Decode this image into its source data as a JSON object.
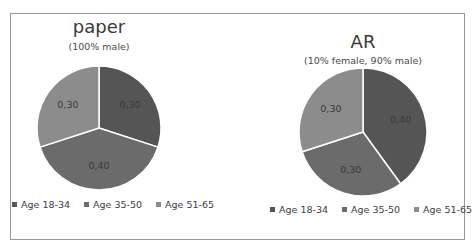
{
  "chart_data": [
    {
      "type": "pie",
      "title": "paper",
      "subtitle": "(100% male)",
      "categories": [
        "Age 18-34",
        "Age 35-50",
        "Age 51-65"
      ],
      "values": [
        0.3,
        0.4,
        0.3
      ],
      "data_labels": [
        "0,30",
        "0,40",
        "0,30"
      ],
      "colors": [
        "#555555",
        "#6b6b6b",
        "#8c8c8c"
      ],
      "legend_position": "bottom"
    },
    {
      "type": "pie",
      "title": "AR",
      "subtitle": "(10% female, 90% male)",
      "categories": [
        "Age 18-34",
        "Age 35-50",
        "Age 51-65"
      ],
      "values": [
        0.4,
        0.3,
        0.3
      ],
      "data_labels": [
        "0,40",
        "0,30",
        "0,30"
      ],
      "colors": [
        "#555555",
        "#6b6b6b",
        "#8c8c8c"
      ],
      "legend_position": "bottom"
    }
  ]
}
